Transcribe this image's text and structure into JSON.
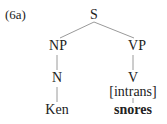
{
  "example_label": "(6a)",
  "tree": {
    "root": "S",
    "np": "NP",
    "vp": "VP",
    "n": "N",
    "v": "V",
    "v_feature": "[intrans]",
    "n_word": "Ken",
    "v_word": "snores"
  }
}
